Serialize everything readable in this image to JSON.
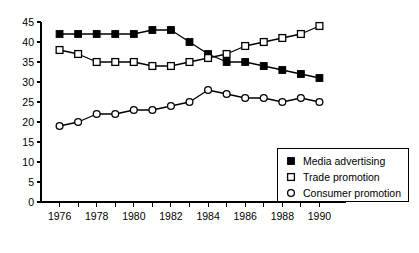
{
  "chart_data": {
    "type": "line",
    "title": "",
    "subtitle": "",
    "xlabel": "",
    "ylabel": "",
    "xlim": [
      1975,
      1991
    ],
    "ylim": [
      0,
      45
    ],
    "grid": false,
    "legend_position": "bottom-right",
    "x": [
      1976,
      1977,
      1978,
      1979,
      1980,
      1981,
      1982,
      1983,
      1984,
      1985,
      1986,
      1987,
      1988,
      1989,
      1990
    ],
    "x_tick_labels": [
      "1976",
      "",
      "1978",
      "",
      "1980",
      "",
      "1982",
      "",
      "1984",
      "",
      "1986",
      "",
      "1988",
      "",
      "1990"
    ],
    "y_ticks": [
      0,
      5,
      10,
      15,
      20,
      25,
      30,
      35,
      40,
      45
    ],
    "y_tick_labels": [
      "0",
      "5",
      "10",
      "15",
      "20",
      "25",
      "30",
      "35",
      "40",
      "45"
    ],
    "series": [
      {
        "name": "Media advertising",
        "marker": "filled-square",
        "color": "#000000",
        "values": [
          42,
          42,
          42,
          42,
          42,
          43,
          43,
          40,
          37,
          35,
          35,
          34,
          33,
          32,
          31
        ]
      },
      {
        "name": "Trade promotion",
        "marker": "open-square",
        "color": "#000000",
        "values": [
          38,
          37,
          35,
          35,
          35,
          34,
          34,
          35,
          36,
          37,
          39,
          40,
          41,
          42,
          44
        ]
      },
      {
        "name": "Consumer promotion",
        "marker": "open-circle",
        "color": "#000000",
        "values": [
          19,
          20,
          22,
          22,
          23,
          23,
          24,
          25,
          28,
          27,
          26,
          26,
          25,
          26,
          25
        ]
      }
    ],
    "annotations": []
  },
  "legend": {
    "items": [
      {
        "label": "Media advertising",
        "marker": "filled-square"
      },
      {
        "label": "Trade promotion",
        "marker": "open-square"
      },
      {
        "label": "Consumer promotion",
        "marker": "open-circle"
      }
    ]
  }
}
